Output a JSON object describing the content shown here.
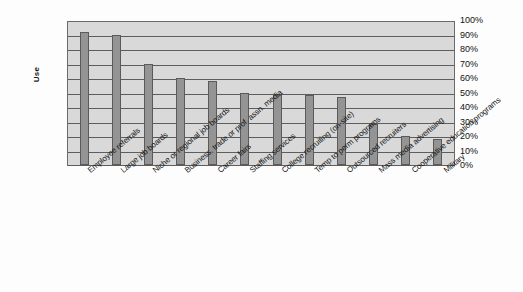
{
  "chart_data": {
    "type": "bar",
    "title": "",
    "xlabel": "",
    "ylabel": "Use",
    "ylim": [
      0,
      100
    ],
    "grid": true,
    "legend": "none",
    "orientation": "vertical",
    "value_suffix": "%",
    "categories": [
      "Employee referrals",
      "Large job boards",
      "Niche or regional job boards",
      "Business, trade or prof. assn. media",
      "Career fairs",
      "Staffing services",
      "College recruiting (on-site)",
      "Temp to perm programs",
      "Outsourced recruiters",
      "Mass media advertising",
      "Cooperative education programs",
      "Military"
    ],
    "values": [
      92,
      90,
      70,
      60,
      58,
      50,
      49,
      48,
      47,
      28,
      20,
      18
    ],
    "ytick_labels": [
      "100%",
      "90%",
      "80%",
      "70%",
      "60%",
      "50%",
      "40%",
      "30%",
      "20%",
      "10%",
      "0%"
    ],
    "ytick_values": [
      100,
      90,
      80,
      70,
      60,
      50,
      40,
      30,
      20,
      10,
      0
    ],
    "colors": {
      "bar_fill": "#949494",
      "bar_border": "#5a5a5a",
      "plot_background": "#d9d9d9",
      "gridline": "#5d5d5d",
      "frame_border": "#6a6a6a",
      "page_background": "#fdfdfd",
      "text": "#161616"
    }
  }
}
